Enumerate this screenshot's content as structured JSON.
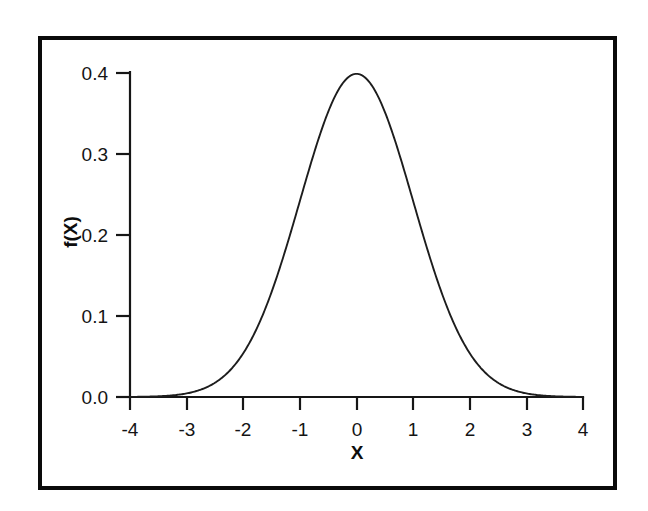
{
  "figure": {
    "background_color": "#ffffff",
    "frame_color": "#0a0a0a",
    "axis_color": "#161616",
    "curve_color": "#1d1d1d"
  },
  "chart_data": {
    "type": "line",
    "title": "",
    "subtitle": "",
    "xlabel": "X",
    "ylabel": "f(X)",
    "xlim": [
      -4,
      4
    ],
    "ylim": [
      0.0,
      0.4
    ],
    "grid": false,
    "legend": null,
    "annotations": [],
    "distribution": "standard normal probability density function, mean 0, standard deviation 1",
    "xticks": [
      -4,
      -3,
      -2,
      -1,
      0,
      1,
      2,
      3,
      4
    ],
    "xticklabels": [
      "-4",
      "-3",
      "-2",
      "-1",
      "0",
      "1",
      "2",
      "3",
      "4"
    ],
    "yticks": [
      0.0,
      0.1,
      0.2,
      0.3,
      0.4
    ],
    "yticklabels": [
      "0.0",
      "0.1",
      "0.2",
      "0.3",
      "0.4"
    ],
    "series": [
      {
        "name": "f(X)",
        "x": [
          -4.0,
          -3.8,
          -3.6,
          -3.4,
          -3.2,
          -3.0,
          -2.8,
          -2.6,
          -2.4,
          -2.2,
          -2.0,
          -1.8,
          -1.6,
          -1.4,
          -1.2,
          -1.0,
          -0.8,
          -0.6,
          -0.4,
          -0.2,
          0.0,
          0.2,
          0.4,
          0.6,
          0.8,
          1.0,
          1.2,
          1.4,
          1.6,
          1.8,
          2.0,
          2.2,
          2.4,
          2.6,
          2.8,
          3.0,
          3.2,
          3.4,
          3.6,
          3.8,
          4.0
        ],
        "values": [
          0.0001,
          0.0003,
          0.0006,
          0.0012,
          0.0024,
          0.0044,
          0.0079,
          0.0136,
          0.0224,
          0.0355,
          0.054,
          0.079,
          0.1109,
          0.1497,
          0.1942,
          0.242,
          0.2897,
          0.3332,
          0.3683,
          0.391,
          0.3989,
          0.391,
          0.3683,
          0.3332,
          0.2897,
          0.242,
          0.1942,
          0.1497,
          0.1109,
          0.079,
          0.054,
          0.0355,
          0.0224,
          0.0136,
          0.0079,
          0.0044,
          0.0024,
          0.0012,
          0.0006,
          0.0003,
          0.0001
        ]
      }
    ],
    "peak": {
      "x": 0.0,
      "y": 0.3989
    }
  }
}
